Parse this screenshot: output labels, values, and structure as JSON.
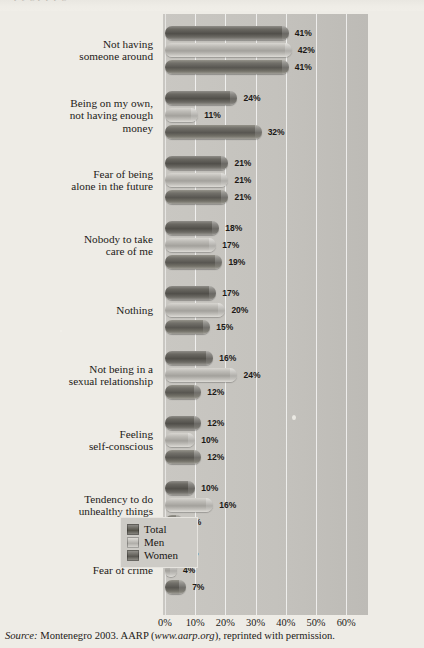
{
  "page": {
    "top_cut_text": "p   y  g     p   p   p   g",
    "source_prefix": "Source:",
    "source_text": " Montenegro 2003. AARP (",
    "source_url": "www.aarp.org",
    "source_suffix": "), reprinted with permission."
  },
  "legend": {
    "items": [
      {
        "label": "Total",
        "swatch": "total-swatch",
        "color": "#545249"
      },
      {
        "label": "Men",
        "swatch": "men-swatch",
        "color": "#b0aea9"
      },
      {
        "label": "Women",
        "swatch": "women-swatch",
        "color": "#5a5852"
      }
    ]
  },
  "chart_data": {
    "type": "bar",
    "orientation": "horizontal",
    "title": "",
    "xlabel": "",
    "ylabel": "",
    "xlim": [
      0,
      60
    ],
    "xticks": [
      "0%",
      "10%",
      "20%",
      "30%",
      "40%",
      "50%",
      "60%"
    ],
    "xtick_values": [
      0,
      10,
      20,
      30,
      40,
      50,
      60
    ],
    "grid": true,
    "legend_position": "bottom-right-inside",
    "categories": [
      "Not having\nsomeone around",
      "Being on my own,\nnot having enough\nmoney",
      "Fear of being\nalone in the future",
      "Nobody to take\ncare of me",
      "Nothing",
      "Not being in a\nsexual relationship",
      "Feeling\nself-conscious",
      "Tendency to do\nunhealthy things",
      "Fear of crime"
    ],
    "series": [
      {
        "name": "Total",
        "values": [
          41,
          24,
          21,
          18,
          17,
          16,
          12,
          10,
          5
        ],
        "labels": [
          "41%",
          "24%",
          "21%",
          "18%",
          "17%",
          "16%",
          "12%",
          "10%",
          "5%"
        ]
      },
      {
        "name": "Men",
        "values": [
          42,
          11,
          21,
          17,
          20,
          24,
          10,
          16,
          4
        ],
        "labels": [
          "42%",
          "11%",
          "21%",
          "17%",
          "20%",
          "24%",
          "10%",
          "16%",
          "4%"
        ]
      },
      {
        "name": "Women",
        "values": [
          41,
          32,
          21,
          19,
          15,
          12,
          12,
          6,
          7
        ],
        "labels": [
          "41%",
          "32%",
          "21%",
          "19%",
          "15%",
          "12%",
          "12%",
          "6%",
          "7%"
        ]
      }
    ]
  }
}
